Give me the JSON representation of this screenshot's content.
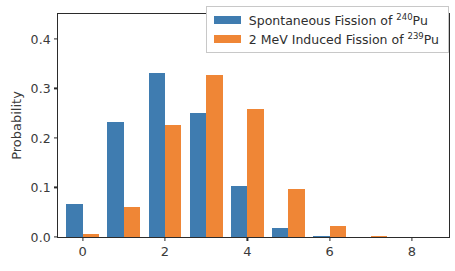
{
  "chart_data": {
    "type": "bar",
    "title": "",
    "xlabel": "",
    "ylabel": "Probability",
    "categories": [
      0,
      1,
      2,
      3,
      4,
      5,
      6,
      7,
      8
    ],
    "series": [
      {
        "name": "Spontaneous Fission of 240Pu",
        "name_prefix": "Spontaneous Fission of ",
        "name_superscript": "240",
        "name_suffix": "Pu",
        "color": "#3f7cb0",
        "values": [
          0.066,
          0.232,
          0.33,
          0.251,
          0.103,
          0.018,
          0.003,
          0.0,
          0.0
        ]
      },
      {
        "name": "2 MeV Induced Fission of 239Pu",
        "name_prefix": "2 MeV Induced Fission of ",
        "name_superscript": "239",
        "name_suffix": "Pu",
        "color": "#ef8636",
        "values": [
          0.007,
          0.06,
          0.227,
          0.326,
          0.258,
          0.096,
          0.022,
          0.003,
          0.0
        ]
      }
    ],
    "xticks": [
      "0",
      "2",
      "4",
      "6",
      "8"
    ],
    "xtick_values": [
      0,
      2,
      4,
      6,
      8
    ],
    "yticks": [
      "0.0",
      "0.1",
      "0.2",
      "0.3",
      "0.4"
    ],
    "ytick_values": [
      0.0,
      0.1,
      0.2,
      0.3,
      0.4
    ],
    "xlim": [
      -0.6,
      8.9
    ],
    "ylim": [
      0.0,
      0.45
    ],
    "grid": false,
    "legend_position": "upper right",
    "bar_width": 0.4
  }
}
